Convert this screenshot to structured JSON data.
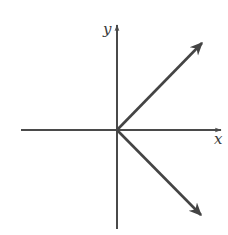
{
  "diagram": {
    "type": "coordinate-plane-with-vectors",
    "colors": {
      "axis": "#4a4a4a",
      "vector": "#444444",
      "label": "#3a3a3a",
      "background": "#ffffff"
    },
    "origin": {
      "x": 117,
      "y": 130
    },
    "axes": {
      "x": {
        "label": "x",
        "from": [
          21,
          130
        ],
        "to": [
          221,
          130
        ],
        "label_pos": [
          214,
          144
        ]
      },
      "y": {
        "label": "y",
        "from": [
          117,
          229
        ],
        "to": [
          117,
          25
        ],
        "label_pos": [
          103,
          34
        ]
      }
    },
    "vectors": [
      {
        "name": "upper-right",
        "from": [
          117,
          130
        ],
        "to": [
          202,
          43
        ]
      },
      {
        "name": "lower-right",
        "from": [
          117,
          130
        ],
        "to": [
          201,
          215
        ]
      }
    ]
  }
}
